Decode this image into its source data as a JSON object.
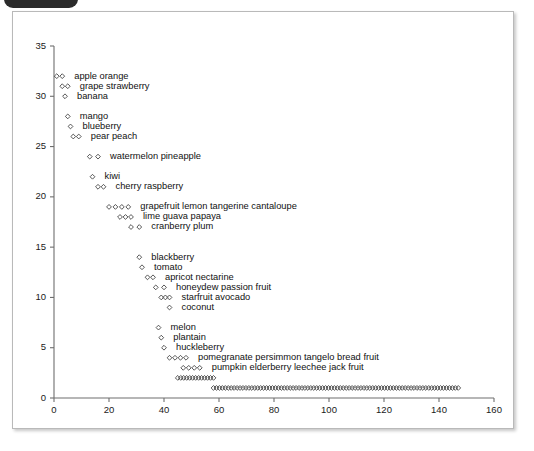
{
  "window": {
    "tab_fragment": "",
    "card_background": "#ffffff",
    "card_border_color": "#b9b9b9"
  },
  "chart_data": {
    "type": "scatter",
    "title": "",
    "subtitle": "",
    "xlabel": "",
    "ylabel": "",
    "xlim": [
      0,
      160
    ],
    "ylim": [
      0,
      35
    ],
    "xticks": [
      0,
      20,
      40,
      60,
      80,
      100,
      120,
      140,
      160
    ],
    "yticks": [
      0,
      5,
      10,
      15,
      20,
      25,
      30,
      35
    ],
    "xtick_labels": [
      "0",
      "20",
      "40",
      "60",
      "80",
      "100",
      "120",
      "140",
      "160"
    ],
    "ytick_labels": [
      "0",
      "5",
      "10",
      "15",
      "20",
      "25",
      "30",
      "35"
    ],
    "grid": false,
    "legend": "none",
    "marker": "open-diamond",
    "marker_color": "#3a3a3a",
    "rows": [
      {
        "y": 32,
        "x_start": 1,
        "x_end": 3,
        "count": 2,
        "labels": [
          "apple",
          "orange"
        ]
      },
      {
        "y": 31,
        "x_start": 3,
        "x_end": 5,
        "count": 2,
        "labels": [
          "grape",
          "strawberry"
        ]
      },
      {
        "y": 30,
        "x_start": 4,
        "x_end": 4,
        "count": 1,
        "labels": [
          "banana"
        ]
      },
      {
        "y": 28,
        "x_start": 5,
        "x_end": 5,
        "count": 1,
        "labels": [
          "mango"
        ]
      },
      {
        "y": 27,
        "x_start": 6,
        "x_end": 6,
        "count": 1,
        "labels": [
          "blueberry"
        ]
      },
      {
        "y": 26,
        "x_start": 7,
        "x_end": 9,
        "count": 2,
        "labels": [
          "pear",
          "peach"
        ]
      },
      {
        "y": 24,
        "x_start": 13,
        "x_end": 16,
        "count": 2,
        "labels": [
          "watermelon",
          "pineapple"
        ]
      },
      {
        "y": 22,
        "x_start": 14,
        "x_end": 14,
        "count": 1,
        "labels": [
          "kiwi"
        ]
      },
      {
        "y": 21,
        "x_start": 16,
        "x_end": 18,
        "count": 2,
        "labels": [
          "cherry",
          "raspberry"
        ]
      },
      {
        "y": 19,
        "x_start": 20,
        "x_end": 27,
        "count": 4,
        "labels": [
          "grapefruit",
          "lemon",
          "tangerine",
          "cantaloupe"
        ]
      },
      {
        "y": 18,
        "x_start": 24,
        "x_end": 28,
        "count": 3,
        "labels": [
          "lime",
          "guava",
          "papaya"
        ]
      },
      {
        "y": 17,
        "x_start": 28,
        "x_end": 31,
        "count": 2,
        "labels": [
          "cranberry",
          "plum"
        ]
      },
      {
        "y": 14,
        "x_start": 31,
        "x_end": 31,
        "count": 1,
        "labels": [
          "blackberry"
        ]
      },
      {
        "y": 13,
        "x_start": 32,
        "x_end": 32,
        "count": 1,
        "labels": [
          "tomato"
        ]
      },
      {
        "y": 12,
        "x_start": 34,
        "x_end": 36,
        "count": 2,
        "labels": [
          "apricot",
          "nectarine"
        ]
      },
      {
        "y": 11,
        "x_start": 37,
        "x_end": 40,
        "count": 2,
        "labels": [
          "honeydew",
          "passion fruit"
        ]
      },
      {
        "y": 10,
        "x_start": 39,
        "x_end": 42,
        "count": 3,
        "labels": [
          "starfruit",
          "avocado"
        ]
      },
      {
        "y": 9,
        "x_start": 42,
        "x_end": 42,
        "count": 1,
        "labels": [
          "coconut"
        ]
      },
      {
        "y": 7,
        "x_start": 38,
        "x_end": 38,
        "count": 1,
        "labels": [
          "melon"
        ]
      },
      {
        "y": 6,
        "x_start": 39,
        "x_end": 39,
        "count": 1,
        "labels": [
          "plantain"
        ]
      },
      {
        "y": 5,
        "x_start": 40,
        "x_end": 40,
        "count": 1,
        "labels": [
          "huckleberry"
        ]
      },
      {
        "y": 4,
        "x_start": 42,
        "x_end": 48,
        "count": 4,
        "labels": [
          "pomegranate",
          "persimmon",
          "tangelo",
          "bread fruit"
        ]
      },
      {
        "y": 3,
        "x_start": 47,
        "x_end": 53,
        "count": 4,
        "labels": [
          "pumpkin",
          "elderberry",
          "leechee",
          "jack fruit"
        ]
      },
      {
        "y": 2,
        "x_start": 45,
        "x_end": 58,
        "count": 13,
        "labels": []
      },
      {
        "y": 1,
        "x_start": 58,
        "x_end": 147,
        "count": 84,
        "labels": []
      }
    ]
  }
}
